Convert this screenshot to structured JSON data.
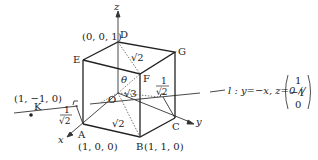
{
  "diagram": {
    "type": "3d-cube-geometry",
    "axes": {
      "x": "x",
      "y": "y",
      "z": "z"
    },
    "vertices": {
      "O": {
        "label": "O"
      },
      "A": {
        "label": "A",
        "coord": "(1, 0, 0)"
      },
      "B": {
        "label": "B",
        "coord": "(1, 1, 0)"
      },
      "C": {
        "label": "C"
      },
      "D": {
        "label": "D",
        "coord": "(0, 0, 1)"
      },
      "E": {
        "label": "E"
      },
      "F": {
        "label": "F"
      },
      "G": {
        "label": "G"
      },
      "K": {
        "label": "K",
        "coord": "(1, −1, 0)"
      }
    },
    "annotations": {
      "sqrt2_top": "√2",
      "sqrt3": "√3",
      "theta": "θ",
      "sqrt2_bottom": "√2",
      "frac_left_num": "1",
      "frac_left_den": "√2",
      "frac_right_num": "1",
      "frac_right_den": "√2"
    },
    "line_l": {
      "equation": "l : y=−x, z=0 //",
      "vector": [
        "1",
        "−1",
        "0"
      ]
    }
  }
}
